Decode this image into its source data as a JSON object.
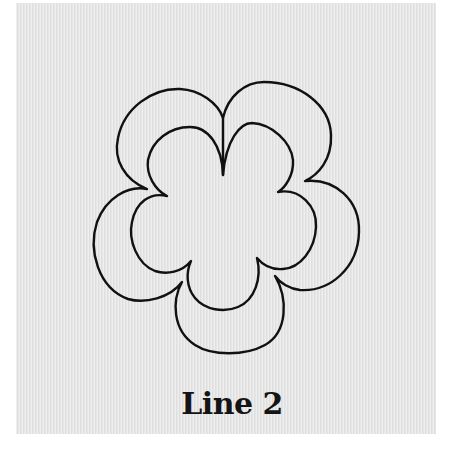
{
  "figure": {
    "caption": "Line 2",
    "panel_color": "#e6e6e6",
    "line_color": "#111111"
  }
}
